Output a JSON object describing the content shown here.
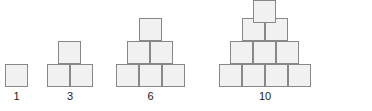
{
  "figure": {
    "square_size": 23,
    "colors": {
      "square_fill": "#f1f1f1",
      "square_border": "#888888",
      "label_text": "#1a1a1a",
      "background": "#ffffff"
    },
    "groups": [
      {
        "name": "group-1",
        "label": "1",
        "count": 1,
        "rows": 1,
        "label_x": 5,
        "label_y": 90,
        "label_width": 23,
        "squares": [
          {
            "x": 5,
            "y": 64
          }
        ]
      },
      {
        "name": "group-2",
        "label": "3",
        "count": 3,
        "rows": 2,
        "label_x": 47,
        "label_y": 90,
        "label_width": 46,
        "squares": [
          {
            "x": 47,
            "y": 64
          },
          {
            "x": 70,
            "y": 64
          },
          {
            "x": 58,
            "y": 41
          }
        ]
      },
      {
        "name": "group-3",
        "label": "6",
        "count": 6,
        "rows": 3,
        "label_x": 116,
        "label_y": 90,
        "label_width": 69,
        "squares": [
          {
            "x": 116,
            "y": 64
          },
          {
            "x": 139,
            "y": 64
          },
          {
            "x": 162,
            "y": 64
          },
          {
            "x": 127,
            "y": 41
          },
          {
            "x": 150,
            "y": 41
          },
          {
            "x": 139,
            "y": 18
          }
        ]
      },
      {
        "name": "group-4",
        "label": "10",
        "count": 10,
        "rows": 4,
        "label_x": 219,
        "label_y": 90,
        "label_width": 92,
        "squares": [
          {
            "x": 219,
            "y": 64
          },
          {
            "x": 242,
            "y": 64
          },
          {
            "x": 265,
            "y": 64
          },
          {
            "x": 288,
            "y": 64
          },
          {
            "x": 230,
            "y": 41
          },
          {
            "x": 253,
            "y": 41
          },
          {
            "x": 276,
            "y": 41
          },
          {
            "x": 242,
            "y": 18
          },
          {
            "x": 265,
            "y": 18
          },
          {
            "x": 253,
            "y": 0
          }
        ]
      }
    ]
  }
}
